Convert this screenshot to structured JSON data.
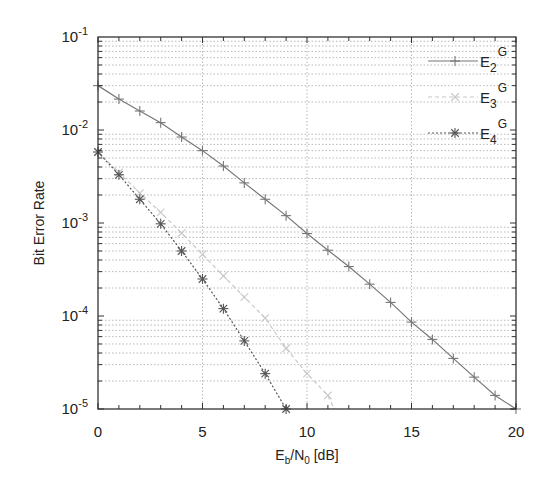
{
  "chart_data": {
    "type": "line",
    "title": "",
    "xlabel": "E_b/N_0 [dB]",
    "xlabel_parts": {
      "main1": "E",
      "sub1": "b",
      "main2": "/N",
      "sub2": "0",
      "rest": " [dB]"
    },
    "ylabel": "Bit Error Rate",
    "xlim": [
      0,
      20
    ],
    "ylim": [
      1e-05,
      0.1
    ],
    "yscale": "log",
    "grid": true,
    "legend_position": "top-right",
    "x_ticks": [
      0,
      5,
      10,
      15,
      20
    ],
    "x_tick_labels": [
      "0",
      "5",
      "10",
      "15",
      "20"
    ],
    "y_ticks": [
      0.1,
      0.01,
      0.001,
      0.0001,
      1e-05
    ],
    "y_tick_labels": [
      {
        "base": "10",
        "exp": "-1"
      },
      {
        "base": "10",
        "exp": "-2"
      },
      {
        "base": "10",
        "exp": "-3"
      },
      {
        "base": "10",
        "exp": "-4"
      },
      {
        "base": "10",
        "exp": "-5"
      }
    ],
    "series": [
      {
        "name": "E2^G",
        "label_main": "E",
        "label_sub": "2",
        "label_sup": "G",
        "color": "#777777",
        "marker": "plus",
        "dash": "solid",
        "x": [
          0,
          1,
          2,
          3,
          4,
          5,
          6,
          7,
          8,
          9,
          10,
          11,
          12,
          13,
          14,
          15,
          16,
          17,
          18,
          19,
          20
        ],
        "values": [
          0.03,
          0.0215,
          0.016,
          0.012,
          0.0084,
          0.006,
          0.0041,
          0.0027,
          0.0018,
          0.0012,
          0.00077,
          0.00051,
          0.00034,
          0.00022,
          0.00014,
          8.6e-05,
          5.6e-05,
          3.5e-05,
          2.2e-05,
          1.4e-05,
          1e-05
        ]
      },
      {
        "name": "E3^G",
        "label_main": "E",
        "label_sub": "3",
        "label_sup": "G",
        "color": "#c8c8c8",
        "marker": "x",
        "dash": "dashed",
        "x": [
          0,
          1,
          2,
          3,
          4,
          5,
          6,
          7,
          8,
          9,
          10,
          11,
          11.3
        ],
        "values": [
          0.0058,
          0.0035,
          0.0021,
          0.0013,
          0.00078,
          0.00046,
          0.00027,
          0.00016,
          9.5e-05,
          4.5e-05,
          2.4e-05,
          1.4e-05,
          1e-05
        ]
      },
      {
        "name": "E4^G",
        "label_main": "E",
        "label_sub": "4",
        "label_sup": "G",
        "color": "#555555",
        "marker": "star",
        "dash": "dotted",
        "x": [
          0,
          1,
          2,
          3,
          4,
          5,
          6,
          7,
          8,
          9
        ],
        "values": [
          0.0058,
          0.0033,
          0.0018,
          0.00098,
          0.0005,
          0.00025,
          0.00012,
          5.4e-05,
          2.4e-05,
          1e-05
        ]
      }
    ]
  }
}
